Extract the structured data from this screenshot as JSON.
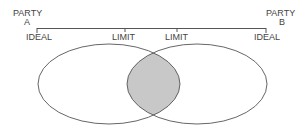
{
  "party_a": {
    "line1": "PARTY",
    "line2": "A"
  },
  "party_b": {
    "line1": "PARTY",
    "line2": "B"
  },
  "scale_labels": {
    "a_ideal": "IDEAL",
    "a_limit": "LIMIT",
    "b_limit": "LIMIT",
    "b_ideal": "IDEAL"
  },
  "colors": {
    "line": "#555555",
    "overlap_fill": "#c8c8c8"
  }
}
